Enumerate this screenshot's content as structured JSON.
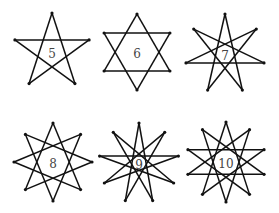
{
  "figure": {
    "stars": [
      {
        "points": 5,
        "label": "5",
        "step": 2
      },
      {
        "points": 6,
        "label": "6",
        "step": 2
      },
      {
        "points": 7,
        "label": "7",
        "step": 3
      },
      {
        "points": 8,
        "label": "8",
        "step": 3
      },
      {
        "points": 9,
        "label": "9",
        "step": 4
      },
      {
        "points": 10,
        "label": "10",
        "step": 4
      }
    ],
    "colors": {
      "stroke": "#111111",
      "label": "#444444",
      "background": "#ffffff"
    }
  }
}
